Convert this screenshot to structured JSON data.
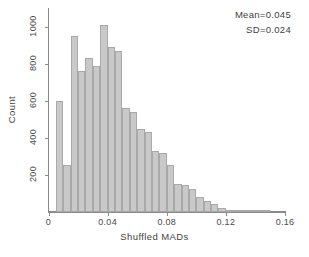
{
  "chart_data": {
    "type": "bar",
    "title": "",
    "subtitle": "",
    "xlabel": "Shuffled MADs",
    "ylabel": "Count",
    "xlim": [
      0,
      0.16
    ],
    "ylim": [
      0,
      1100
    ],
    "grid": false,
    "legend": null,
    "bin_width": 0.005,
    "bar_color": "#c9c9c9",
    "bar_edge_color": "#a9a9a9",
    "axis_color": "#8a8a8a",
    "xticks": [
      0,
      0.04,
      0.08,
      0.12,
      0.16
    ],
    "xtick_labels": [
      "0",
      "0.04",
      "0.08",
      "0.12",
      "0.16"
    ],
    "yticks": [
      200,
      400,
      600,
      800,
      1000
    ],
    "ytick_labels": [
      "200",
      "400",
      "600",
      "800",
      "1000"
    ],
    "bin_centers": [
      0.0075,
      0.0125,
      0.0175,
      0.0225,
      0.0275,
      0.0325,
      0.0375,
      0.0425,
      0.0475,
      0.0525,
      0.0575,
      0.0625,
      0.0675,
      0.0725,
      0.0775,
      0.0825,
      0.0875,
      0.0925,
      0.0975,
      0.1025,
      0.1075,
      0.1125,
      0.1175,
      0.1225,
      0.1275,
      0.1325,
      0.1375,
      0.1425,
      0.1475
    ],
    "categories": [
      "0.0075",
      "0.0125",
      "0.0175",
      "0.0225",
      "0.0275",
      "0.0325",
      "0.0375",
      "0.0425",
      "0.0475",
      "0.0525",
      "0.0575",
      "0.0625",
      "0.0675",
      "0.0725",
      "0.0775",
      "0.0825",
      "0.0875",
      "0.0925",
      "0.0975",
      "0.1025",
      "0.1075",
      "0.1125",
      "0.1175",
      "0.1225",
      "0.1275",
      "0.1325",
      "0.1375",
      "0.1425",
      "0.1475"
    ],
    "values": [
      600,
      255,
      950,
      760,
      830,
      790,
      1010,
      890,
      870,
      560,
      540,
      450,
      430,
      330,
      320,
      255,
      150,
      145,
      125,
      80,
      60,
      45,
      22,
      12,
      8,
      5,
      3,
      2,
      1
    ],
    "annotations": [
      {
        "text": "Mean=0.045",
        "value": 0.045,
        "stat": "Mean"
      },
      {
        "text": "SD=0.024",
        "value": 0.024,
        "stat": "SD"
      }
    ]
  }
}
